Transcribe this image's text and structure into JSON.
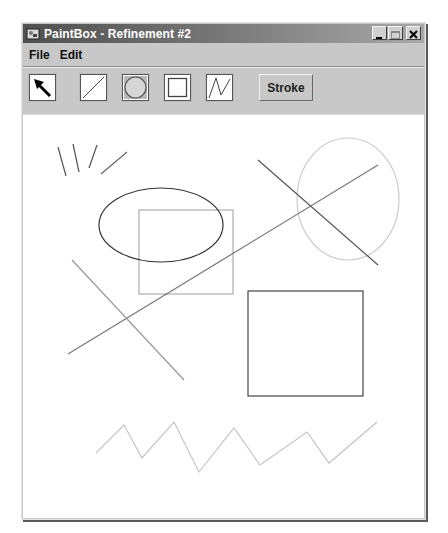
{
  "window": {
    "title": "PaintBox - Refinement #2",
    "app_icon": "paintbox-app-icon",
    "controls": [
      {
        "name": "minimize",
        "icon": "minimize-icon"
      },
      {
        "name": "maximize",
        "icon": "maximize-icon"
      },
      {
        "name": "close",
        "icon": "close-icon"
      }
    ]
  },
  "menubar": {
    "items": [
      {
        "label": "File"
      },
      {
        "label": "Edit"
      }
    ]
  },
  "toolbar": {
    "tools": [
      {
        "name": "select",
        "icon": "arrow-pointer-icon",
        "selected": false
      },
      {
        "name": "line",
        "icon": "line-icon",
        "selected": false
      },
      {
        "name": "oval",
        "icon": "oval-icon",
        "selected": true
      },
      {
        "name": "rectangle",
        "icon": "rectangle-icon",
        "selected": false
      },
      {
        "name": "polyline",
        "icon": "polyline-icon",
        "selected": false
      }
    ],
    "stroke_label": "Stroke"
  },
  "canvas": {
    "shapes": [
      {
        "type": "line",
        "x1": 58,
        "y1": 147,
        "x2": 66,
        "y2": 176,
        "color": "#555555"
      },
      {
        "type": "line",
        "x1": 73,
        "y1": 144,
        "x2": 79,
        "y2": 172,
        "color": "#555555"
      },
      {
        "type": "line",
        "x1": 97,
        "y1": 145,
        "x2": 89,
        "y2": 168,
        "color": "#555555"
      },
      {
        "type": "line",
        "x1": 127,
        "y1": 152,
        "x2": 101,
        "y2": 174,
        "color": "#666666"
      },
      {
        "type": "rect",
        "x": 139,
        "y": 210,
        "w": 94,
        "h": 84,
        "color": "#b0b0b0"
      },
      {
        "type": "ellipse",
        "cx": 161,
        "cy": 225,
        "rx": 62,
        "ry": 37,
        "color": "#333333"
      },
      {
        "type": "ellipse",
        "cx": 348,
        "cy": 199,
        "rx": 51,
        "ry": 61,
        "color": "#cccccc"
      },
      {
        "type": "line",
        "x1": 258,
        "y1": 160,
        "x2": 378,
        "y2": 265,
        "color": "#555555"
      },
      {
        "type": "line",
        "x1": 68,
        "y1": 354,
        "x2": 378,
        "y2": 165,
        "color": "#777777"
      },
      {
        "type": "line",
        "x1": 72,
        "y1": 260,
        "x2": 184,
        "y2": 380,
        "color": "#999999"
      },
      {
        "type": "rect",
        "x": 248,
        "y": 291,
        "w": 115,
        "h": 105,
        "color": "#444444"
      },
      {
        "type": "polyline",
        "points": "96,453 124,425 142,458 174,422 199,472 234,428 260,465 307,432 329,463 377,422",
        "color": "#c4c4c4"
      }
    ]
  }
}
